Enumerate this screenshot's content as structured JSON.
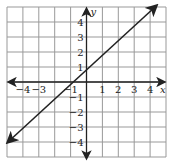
{
  "chart_data": {
    "type": "line",
    "title": "",
    "xlabel": "x",
    "ylabel": "y",
    "xlim": [
      -5,
      5
    ],
    "ylim": [
      -5,
      5
    ],
    "grid": true,
    "x_ticks": [
      "−4",
      "−3",
      "−1",
      "1",
      "2",
      "3",
      "4"
    ],
    "y_ticks": [
      "4",
      "3",
      "2",
      "1",
      "−1",
      "−2",
      "−3",
      "−4"
    ],
    "series": [
      {
        "name": "y = x + 1",
        "x": [
          -5,
          5
        ],
        "y": [
          -4,
          6
        ],
        "slope": 1,
        "intercept": 1
      }
    ]
  },
  "labels": {
    "x": "x",
    "y": "y"
  }
}
